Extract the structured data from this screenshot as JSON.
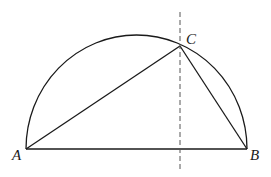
{
  "diagram": {
    "points": {
      "A": {
        "label": "A",
        "x": 26,
        "y": 149,
        "label_x": 12,
        "label_y": 160
      },
      "B": {
        "label": "B",
        "x": 247,
        "y": 149,
        "label_x": 250,
        "label_y": 160
      },
      "C": {
        "label": "C",
        "x": 180,
        "y": 46,
        "label_x": 186,
        "label_y": 44
      }
    },
    "arc": {
      "cx": 136.5,
      "cy": 149,
      "rx": 110.5,
      "ry": 114
    },
    "dashed_line": {
      "x": 180,
      "y1": 12,
      "y2": 172
    },
    "stroke_color": "#1a1a1a",
    "dash_color": "#555555"
  }
}
